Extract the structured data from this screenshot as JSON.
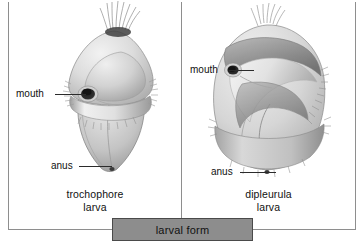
{
  "figure": {
    "banner": {
      "label": "larval form"
    },
    "panels": [
      {
        "id": "trochophore",
        "caption_line1": "trochophore",
        "caption_line2": "larva",
        "labels": [
          {
            "name": "mouth",
            "text": "mouth"
          },
          {
            "name": "anus",
            "text": "anus"
          }
        ],
        "illustration_name": "trochophore-larva-drawing"
      },
      {
        "id": "dipleurula",
        "caption_line1": "dipleurula",
        "caption_line2": "larva",
        "labels": [
          {
            "name": "mouth",
            "text": "mouth"
          },
          {
            "name": "anus",
            "text": "anus"
          }
        ],
        "illustration_name": "dipleurula-larva-drawing"
      }
    ],
    "colors": {
      "frame_line": "#8e8e8e",
      "banner_fill": "#8d8d8d",
      "banner_border": "#4a4a4a",
      "leader_line": "#2b2b2b",
      "text": "#111111",
      "body_light": "#e4e4e4",
      "body_mid": "#c2c2c2",
      "body_shade": "#a0a0a0",
      "body_dark": "#6f6f6f",
      "aperture_dark": "#262626",
      "background": "#ffffff"
    }
  }
}
